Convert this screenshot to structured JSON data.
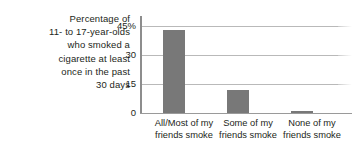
{
  "chart_data": {
    "type": "bar",
    "title": "",
    "subtitle": "",
    "caption_lines": [
      "Percentage of",
      "11- to 17-year-olds",
      "who smoked a",
      "cigarette at least",
      "once in the past",
      "30 days"
    ],
    "categories": [
      "All/Most of my friends smoke",
      "Some of my friends smoke",
      "None of my friends smoke"
    ],
    "category_lines": [
      [
        "All/Most of my",
        "friends smoke"
      ],
      [
        "Some of my",
        "friends smoke"
      ],
      [
        "None of my",
        "friends smoke"
      ]
    ],
    "values": [
      43,
      12,
      1
    ],
    "xlabel": "",
    "ylabel": "",
    "ylim": [
      0,
      45
    ],
    "yticks": [
      0,
      15,
      30,
      45
    ],
    "ytick_labels": [
      "0",
      "15",
      "30",
      "45%"
    ],
    "grid": true,
    "legend": "none",
    "bar_color": "#787878",
    "gridline_color": "#b9b9b9",
    "axis_color": "#8d8d8d",
    "text_color": "#231f20",
    "background_color": "#ffffff"
  }
}
